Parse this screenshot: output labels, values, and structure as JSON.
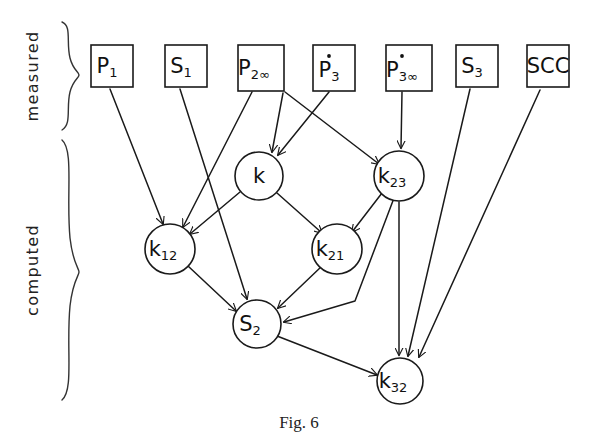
{
  "figure": {
    "caption": "Fig. 6",
    "group_labels": {
      "measured": "measured",
      "computed": "computed"
    },
    "colors": {
      "ink": "#1a1a1a",
      "background": "#ffffff"
    }
  },
  "nodes": {
    "measured": [
      {
        "id": "P1",
        "base": "P",
        "sub": "1",
        "dot": false,
        "shape": "box",
        "x": 91,
        "y": 45,
        "w": 42,
        "h": 42
      },
      {
        "id": "S1",
        "base": "S",
        "sub": "1",
        "dot": false,
        "shape": "box",
        "x": 165,
        "y": 45,
        "w": 42,
        "h": 42
      },
      {
        "id": "P2inf",
        "base": "P",
        "sub": "2∞",
        "dot": false,
        "shape": "box",
        "x": 238,
        "y": 45,
        "w": 46,
        "h": 46
      },
      {
        "id": "P3dot",
        "base": "P",
        "sub": "3",
        "dot": true,
        "shape": "box",
        "x": 313,
        "y": 45,
        "w": 42,
        "h": 46
      },
      {
        "id": "P3inf",
        "base": "P",
        "sub": "3∞",
        "dot": true,
        "shape": "box",
        "x": 386,
        "y": 45,
        "w": 46,
        "h": 46
      },
      {
        "id": "S3",
        "base": "S",
        "sub": "3",
        "dot": false,
        "shape": "box",
        "x": 456,
        "y": 45,
        "w": 42,
        "h": 42
      },
      {
        "id": "SCC",
        "base": "SCC",
        "sub": "",
        "dot": false,
        "shape": "box",
        "x": 527,
        "y": 45,
        "w": 42,
        "h": 42
      }
    ],
    "computed": [
      {
        "id": "k",
        "base": "k",
        "sub": "",
        "shape": "circle",
        "cx": 259,
        "cy": 176,
        "r": 24
      },
      {
        "id": "k23",
        "base": "k",
        "sub": "23",
        "shape": "circle",
        "cx": 399,
        "cy": 176,
        "r": 25
      },
      {
        "id": "k12",
        "base": "k",
        "sub": "12",
        "shape": "circle",
        "cx": 170,
        "cy": 249,
        "r": 25
      },
      {
        "id": "k21",
        "base": "k",
        "sub": "21",
        "shape": "circle",
        "cx": 337,
        "cy": 249,
        "r": 25
      },
      {
        "id": "S2",
        "base": "S",
        "sub": "2",
        "shape": "circle",
        "cx": 257,
        "cy": 324,
        "r": 24
      },
      {
        "id": "k32",
        "base": "k",
        "sub": "32",
        "shape": "circle",
        "cx": 400,
        "cy": 381,
        "r": 23
      }
    ]
  },
  "edges": [
    {
      "from": "P1",
      "to": "k12",
      "path": "M 110,89 L 163,224"
    },
    {
      "from": "S1",
      "to": "S2",
      "path": "M 180,89 L 247,299"
    },
    {
      "from": "P2inf",
      "to": "k12",
      "path": "M 252,92 L 183,227"
    },
    {
      "from": "P2inf",
      "to": "k23",
      "path": "M 285,92 L 379,164"
    },
    {
      "from": "P2inf",
      "to": "k",
      "path": "M 283,93 L 272,152"
    },
    {
      "from": "P3dot",
      "to": "k",
      "path": "M 329,92 L 278,155"
    },
    {
      "from": "P3inf",
      "to": "k23",
      "path": "M 402,92 L 401,148"
    },
    {
      "from": "k",
      "to": "k12",
      "path": "M 240,192 L 190,234"
    },
    {
      "from": "k",
      "to": "k21",
      "path": "M 277,193 L 322,233"
    },
    {
      "from": "k23",
      "to": "k21",
      "path": "M 382,193 L 352,232"
    },
    {
      "from": "k23",
      "to": "k32",
      "path": "M 399,202 L 399,355"
    },
    {
      "from": "k23",
      "to": "S2",
      "path": "M 394,198 L 355,301 L 284,322"
    },
    {
      "from": "k12",
      "to": "S2",
      "path": "M 188,266 L 236,311"
    },
    {
      "from": "k21",
      "to": "S2",
      "path": "M 322,266 L 278,308"
    },
    {
      "from": "S2",
      "to": "k32",
      "path": "M 277,336 L 377,375"
    },
    {
      "from": "S3",
      "to": "k32",
      "path": "M 470,89 L 408,356"
    },
    {
      "from": "SCC",
      "to": "k32",
      "path": "M 540,90 L 419,357"
    }
  ],
  "braces": {
    "measured": {
      "x": 72,
      "top": 22,
      "bottom": 130
    },
    "computed": {
      "x": 72,
      "top": 140,
      "bottom": 400
    }
  }
}
